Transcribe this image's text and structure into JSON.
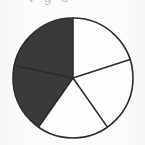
{
  "figure": {
    "background_color": "#fbfbfa",
    "cropped_caption_fragment": "v   g  o",
    "outline_color": "#2b2b2b",
    "outline_width": 1.6
  },
  "chart_data": {
    "type": "pie",
    "title": "",
    "subtitle": "",
    "xlabel": "",
    "ylabel": "",
    "legend": [],
    "legend_position": "none",
    "grid": false,
    "total_slices": 5,
    "shaded_slices": 2,
    "unshaded_slices": 3,
    "fraction_shaded": 0.4,
    "start_angle_deg": 0,
    "direction": "clockwise",
    "center": {
      "x": 73,
      "y": 78
    },
    "radius": 60,
    "colors": {
      "shaded": "#3b3a38",
      "unshaded": "#fdfdfc",
      "edge": "#2b2b2b"
    },
    "categories": [
      "1",
      "2",
      "3",
      "4",
      "5"
    ],
    "values": [
      20,
      20,
      20,
      20,
      20
    ],
    "slices": [
      {
        "index": 0,
        "label": "1",
        "value": 20,
        "start_angle_deg": 0,
        "end_angle_deg": 72,
        "fill": "unshaded",
        "color": "#fdfdfc",
        "position": "upper-right"
      },
      {
        "index": 1,
        "label": "2",
        "value": 20,
        "start_angle_deg": 72,
        "end_angle_deg": 145,
        "fill": "unshaded",
        "color": "#fdfdfc",
        "position": "right"
      },
      {
        "index": 2,
        "label": "3",
        "value": 20,
        "start_angle_deg": 145,
        "end_angle_deg": 215,
        "fill": "unshaded",
        "color": "#fdfdfc",
        "position": "bottom"
      },
      {
        "index": 3,
        "label": "4",
        "value": 20,
        "start_angle_deg": 215,
        "end_angle_deg": 282,
        "fill": "shaded",
        "color": "#3b3a38",
        "position": "lower-left"
      },
      {
        "index": 4,
        "label": "5",
        "value": 20,
        "start_angle_deg": 282,
        "end_angle_deg": 360,
        "fill": "shaded",
        "color": "#3b3a38",
        "position": "upper-left"
      }
    ]
  }
}
